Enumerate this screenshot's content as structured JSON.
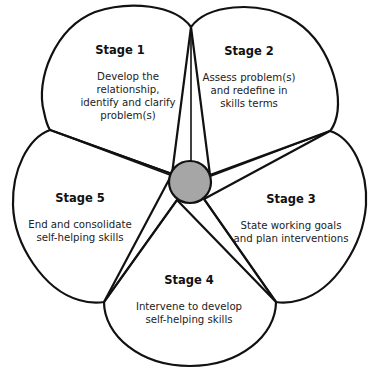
{
  "diagram": {
    "type": "five-petal cycle",
    "hub": {
      "color": "#a6a6a6"
    },
    "stages": [
      {
        "title": "Stage 1",
        "lines": [
          "Develop the",
          "relationship,",
          "identify and clarify",
          "problem(s)"
        ]
      },
      {
        "title": "Stage 2",
        "lines": [
          "Assess problem(s)",
          "and redefine in",
          "skills terms"
        ]
      },
      {
        "title": "Stage 3",
        "lines": [
          "State working goals",
          "and plan interventions"
        ]
      },
      {
        "title": "Stage 4",
        "lines": [
          "Intervene to develop",
          "self-helping skills"
        ]
      },
      {
        "title": "Stage 5",
        "lines": [
          "End and consolidate",
          "self-helping skills"
        ]
      }
    ]
  }
}
